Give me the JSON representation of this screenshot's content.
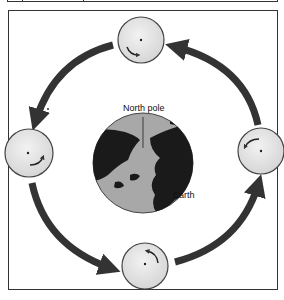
{
  "diagram": {
    "type": "orbit-diagram",
    "labels": {
      "north_pole": "North pole",
      "earth": "Earth"
    },
    "orbit_direction": "counter-clockwise",
    "moon_positions": [
      {
        "position": "top",
        "rotation_arrow": "clockwise-arrow-lower-left"
      },
      {
        "position": "left",
        "rotation_arrow": "arrow-lower-right"
      },
      {
        "position": "bottom",
        "rotation_arrow": "arrow-upper"
      },
      {
        "position": "right",
        "rotation_arrow": "arrow-upper-left"
      }
    ],
    "colors": {
      "arrow": "#333333",
      "moon_fill": "#e6e6e6",
      "earth_ocean": "#a8a8a8",
      "earth_land": "#1a1a1a",
      "frame": "#333333"
    }
  }
}
